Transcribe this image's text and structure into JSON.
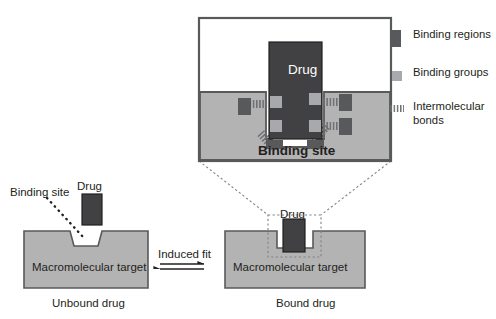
{
  "figure": {
    "colors": {
      "target_fill": "#b3b3b3",
      "target_stroke": "#58595b",
      "drug_fill": "#414042",
      "drug_stroke": "#231f20",
      "binding_region_fill": "#58595b",
      "binding_group_fill": "#a7a9ac",
      "bond_stroke": "#6d6e71",
      "text": "#231f20",
      "inset_border": "#58595b",
      "dotted": "#808285",
      "white": "#ffffff"
    }
  },
  "inset": {
    "drug_label": "Drug",
    "binding_site_label": "Binding site"
  },
  "legend": {
    "items": [
      {
        "label": "Binding regions",
        "swatch": "binding-region-swatch",
        "color": "#58595b"
      },
      {
        "label": "Binding groups",
        "swatch": "binding-group-swatch",
        "color": "#a7a9ac"
      },
      {
        "label": "Intermolecular bonds",
        "swatch": "intermolecular-bond-swatch",
        "color": "#6d6e71"
      }
    ]
  },
  "unbound": {
    "binding_site_label": "Binding site",
    "drug_label": "Drug",
    "target_label": "Macromolecular target",
    "caption": "Unbound drug"
  },
  "transition": {
    "label": "Induced fit",
    "arrow": "equilibrium-double-harpoon"
  },
  "bound": {
    "drug_label": "Drug",
    "target_label": "Macromolecular target",
    "caption": "Bound drug"
  }
}
